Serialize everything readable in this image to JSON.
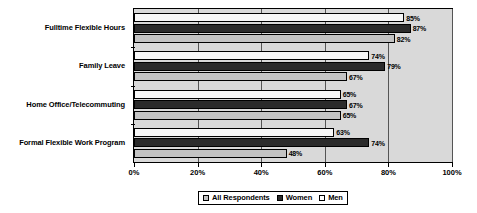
{
  "chart_data": {
    "type": "bar",
    "orientation": "horizontal",
    "title": "",
    "xlabel": "",
    "ylabel": "",
    "xlim": [
      0,
      100
    ],
    "xtick_labels": [
      "0%",
      "20%",
      "40%",
      "60%",
      "80%",
      "100%"
    ],
    "xtick_values": [
      0,
      20,
      40,
      60,
      80,
      100
    ],
    "grid": true,
    "grid_axis": "x",
    "legend_position": "bottom",
    "value_label_suffix": "%",
    "categories": [
      "Fulltime Flexible Hours",
      "Family Leave",
      "Home Office/Telecommuting",
      "Formal Flexible Work Program"
    ],
    "series": [
      {
        "name": "All Respondents",
        "color": "#c3c3c3",
        "values": [
          82,
          67,
          65,
          48
        ],
        "labels": [
          "82%",
          "67%",
          "65%",
          "48%"
        ]
      },
      {
        "name": "Women",
        "color": "#2b2b2b",
        "values": [
          87,
          79,
          67,
          74
        ],
        "labels": [
          "87%",
          "79%",
          "67%",
          "74%"
        ]
      },
      {
        "name": "Men",
        "color": "#f7f7f7",
        "values": [
          85,
          74,
          65,
          63
        ],
        "labels": [
          "85%",
          "74%",
          "65%",
          "63%"
        ]
      }
    ]
  },
  "legend": {
    "items": [
      {
        "label": "All Respondents",
        "swatch": "s-all"
      },
      {
        "label": "Women",
        "swatch": "s-women"
      },
      {
        "label": "Men",
        "swatch": "s-men"
      }
    ]
  },
  "colors": {
    "plot_background": "#d9d9d9",
    "axis": "#000000",
    "gridline": "#555555",
    "all_respondents": "#c3c3c3",
    "women": "#2b2b2b",
    "men": "#f7f7f7"
  }
}
